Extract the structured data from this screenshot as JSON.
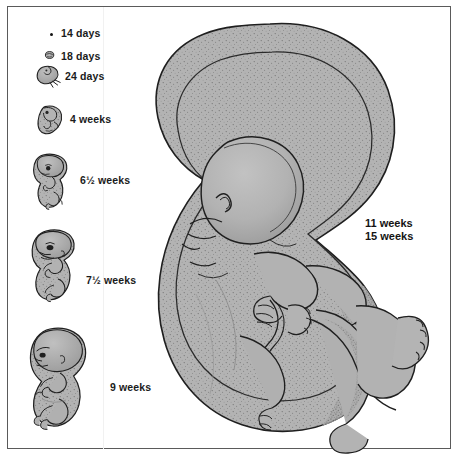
{
  "figure": {
    "border_color": "#5a5a5a",
    "background_color": "#ffffff",
    "tissue_fill_color": "#b0b0b0",
    "outline_color": "#1f1f1f"
  },
  "stages": [
    {
      "id": "14-days",
      "label": "14 days",
      "art": "dot",
      "label_x": 61,
      "label_y": 27
    },
    {
      "id": "18-days",
      "label": "18 days",
      "art": "tiny-disc-embryo",
      "label_x": 61,
      "label_y": 50
    },
    {
      "id": "24-days",
      "label": "24 days",
      "art": "comma-embryo",
      "label_x": 65,
      "label_y": 70
    },
    {
      "id": "4-weeks",
      "label": "4 weeks",
      "art": "c-shaped-embryo",
      "label_x": 70,
      "label_y": 113
    },
    {
      "id": "6-5-weeks",
      "label": "6½ weeks",
      "art": "curled-embryo",
      "label_x": 80,
      "label_y": 174
    },
    {
      "id": "7-5-weeks",
      "label": "7½ weeks",
      "art": "fetus-small",
      "label_x": 86,
      "label_y": 274
    },
    {
      "id": "9-weeks",
      "label": "9 weeks",
      "art": "fetus-medium",
      "label_x": 110,
      "label_y": 381
    }
  ],
  "main_figure": {
    "labels": [
      {
        "id": "11-weeks",
        "text": "11 weeks"
      },
      {
        "id": "15-weeks",
        "text": "15 weeks"
      }
    ],
    "label_x": 365,
    "label_y": 217,
    "description": "Large fetus drawn twice, an 11-week outline nested inside a 15-week outline, shown curled with head down, arms folded across chest and legs drawn up."
  }
}
